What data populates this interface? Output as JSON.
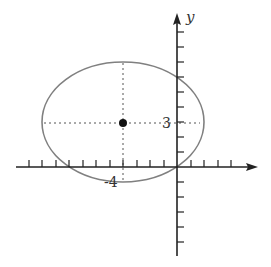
{
  "diagram": {
    "type": "ellipse-on-coordinate-plane",
    "axes": {
      "x_label": "",
      "y_label": "y",
      "origin_px": [
        177,
        167
      ],
      "x_unit_px": 13.5,
      "y_unit_px": 15,
      "x_ticks": [
        -11,
        -10,
        -9,
        -8,
        -7,
        -6,
        -5,
        -4,
        -3,
        -2,
        -1,
        1,
        2,
        3,
        4
      ],
      "y_ticks": [
        9,
        8,
        7,
        6,
        5,
        4,
        3,
        2,
        1,
        -1,
        -2,
        -3,
        -4,
        -5,
        -6
      ]
    },
    "ellipse": {
      "center": [
        -4,
        3
      ],
      "semi_axis_x_px": 81,
      "semi_axis_y_px": 60
    },
    "center_point": {
      "x": -4,
      "y": 3
    },
    "labels": {
      "center_y_value": "3",
      "center_x_value": "-4",
      "y_axis": "y"
    },
    "colors": {
      "axis": "#222222",
      "ellipse": "#808080",
      "dashed_guides": "#555555",
      "point": "#111111",
      "text": "#333333"
    }
  }
}
